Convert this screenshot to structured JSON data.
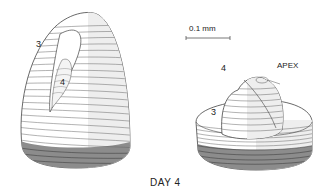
{
  "figure": {
    "caption": "DAY 4",
    "scale_bar": {
      "label": "0.1 mm"
    },
    "left_model": {
      "labels": {
        "primordium_3": "3",
        "primordium_4": "4"
      }
    },
    "right_model": {
      "labels": {
        "apex": "APEX",
        "primordium_3": "3",
        "primordium_4": "4"
      }
    },
    "colors": {
      "line": "#555555",
      "light_face": "#ffffff",
      "shaded_face": "#ececec",
      "dark_band": "#8a8a8a"
    }
  }
}
